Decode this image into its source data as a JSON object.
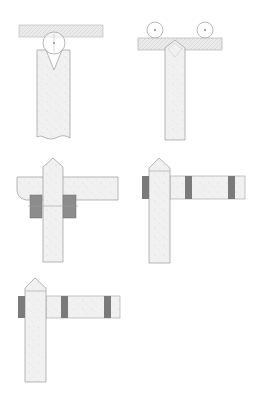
{
  "diagram": {
    "title": "",
    "colors": {
      "background": "#ffffff",
      "stroke": "#9a9a9a",
      "fill_light": "#ececec",
      "fill_speckle": "#f4f4f4",
      "band": "#7a7a7a",
      "block": "#8c8c8c"
    },
    "figures": [
      {
        "id": "fig-1",
        "description": "Round roller resting in V-notch of vertical post under horizontal beam",
        "labels": []
      },
      {
        "id": "fig-2",
        "description": "Two rollers on top of horizontal beam; beam rests on pointed vertical post",
        "labels": []
      },
      {
        "id": "fig-3",
        "description": "Pointed post passing through horizontal arm with two gray clamp blocks",
        "labels": []
      },
      {
        "id": "fig-4",
        "description": "Pointed post with horizontal arm on right; three dark bands",
        "labels": []
      },
      {
        "id": "fig-5",
        "description": "Pointed post with horizontal arm on right; three dark bands (repeat)",
        "labels": []
      }
    ]
  }
}
